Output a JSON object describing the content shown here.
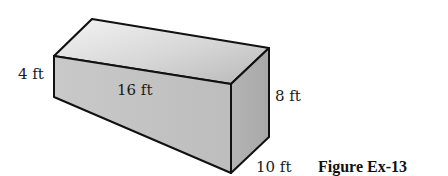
{
  "figure": {
    "caption": "Figure Ex-13",
    "labels": {
      "left_height": "4 ft",
      "length": "16 ft",
      "right_height": "8 ft",
      "width": "10 ft"
    },
    "colors": {
      "top_face_light": "#f2f2f2",
      "top_face_dark": "#bdbdbd",
      "front_face": "#c4c4c4",
      "end_face": "#b0b0b0",
      "edge": "#111111"
    }
  }
}
